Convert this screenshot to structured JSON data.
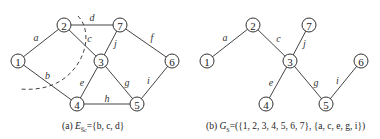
{
  "nodes": [
    "1",
    "2",
    "3",
    "4",
    "5",
    "6",
    "7"
  ],
  "graph_a": {
    "edges": [
      {
        "from": "1",
        "to": "2",
        "label": "a"
      },
      {
        "from": "1",
        "to": "4",
        "label": "b"
      },
      {
        "from": "2",
        "to": "3",
        "label": "c"
      },
      {
        "from": "2",
        "to": "7",
        "label": "d"
      },
      {
        "from": "3",
        "to": "4",
        "label": "e"
      },
      {
        "from": "7",
        "to": "6",
        "label": "f"
      },
      {
        "from": "3",
        "to": "5",
        "label": "g"
      },
      {
        "from": "4",
        "to": "5",
        "label": "h"
      },
      {
        "from": "5",
        "to": "6",
        "label": "i"
      },
      {
        "from": "3",
        "to": "7",
        "label": "j"
      }
    ],
    "cut_edges": [
      "b",
      "c",
      "d"
    ],
    "caption": {
      "prefix": "(a) ",
      "symbol": "E",
      "subscript": "S̅c",
      "rest": "={b, c, d}"
    }
  },
  "graph_b": {
    "edges": [
      {
        "from": "1",
        "to": "2",
        "label": "a"
      },
      {
        "from": "2",
        "to": "3",
        "label": "c"
      },
      {
        "from": "3",
        "to": "7",
        "label": "j"
      },
      {
        "from": "3",
        "to": "4",
        "label": "e"
      },
      {
        "from": "3",
        "to": "5",
        "label": "g"
      },
      {
        "from": "5",
        "to": "6",
        "label": "i"
      }
    ],
    "caption": {
      "prefix": "(b) ",
      "symbol": "G",
      "subscript": "S",
      "rest": "=({1, 2, 3, 4, 5, 6, 7}, {a, c, e, g, i})"
    }
  }
}
